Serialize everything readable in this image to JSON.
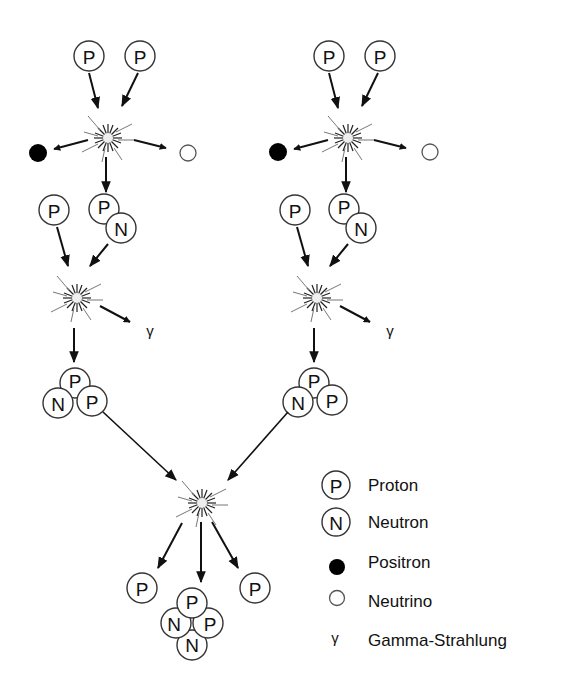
{
  "diagram": {
    "type": "proton-proton chain reaction",
    "particle_labels": {
      "proton": "P",
      "neutron": "N",
      "gamma": "γ"
    },
    "branches": [
      {
        "id": "left",
        "step1_inputs": [
          "P",
          "P"
        ],
        "step1_outputs": [
          "Positron",
          "Neutrino",
          "PN"
        ],
        "step2_inputs": [
          "P",
          "PN"
        ],
        "step2_outputs": [
          "γ",
          "PPN"
        ]
      },
      {
        "id": "right",
        "step1_inputs": [
          "P",
          "P"
        ],
        "step1_outputs": [
          "Positron",
          "Neutrino",
          "PN"
        ],
        "step2_inputs": [
          "P",
          "PN"
        ],
        "step2_outputs": [
          "γ",
          "PPN"
        ]
      }
    ],
    "final_step": {
      "inputs": [
        "PPN",
        "PPN"
      ],
      "outputs": [
        "P",
        "PPNN",
        "P"
      ]
    }
  },
  "legend": {
    "items": [
      {
        "symbol": "P",
        "kind": "circle-letter",
        "label": "Proton"
      },
      {
        "symbol": "N",
        "kind": "circle-letter",
        "label": "Neutron"
      },
      {
        "symbol": "",
        "kind": "filled-dot",
        "label": "Positron"
      },
      {
        "symbol": "",
        "kind": "hollow-dot",
        "label": "Neutrino"
      },
      {
        "symbol": "γ",
        "kind": "glyph",
        "label": "Gamma-Strahlung"
      }
    ]
  }
}
